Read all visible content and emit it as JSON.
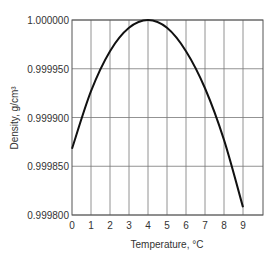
{
  "chart_data": {
    "type": "line",
    "title": "",
    "xlabel": "Temperature, °C",
    "ylabel": "Density, g/cm³",
    "xlim": [
      0,
      10
    ],
    "ylim": [
      0.9998,
      1.0
    ],
    "grid": true,
    "legend": null,
    "x_ticks": [
      "0",
      "1",
      "2",
      "3",
      "4",
      "5",
      "6",
      "7",
      "8",
      "9"
    ],
    "y_ticks": [
      "0.999800",
      "0.999850",
      "0.999900",
      "0.999950",
      "1.000000"
    ],
    "series": [
      {
        "name": "Water density",
        "x": [
          0,
          1,
          2,
          3,
          4,
          5,
          6,
          7,
          8,
          9
        ],
        "values": [
          0.999868,
          0.999927,
          0.999968,
          0.999992,
          1.0,
          0.999992,
          0.999968,
          0.99993,
          0.999877,
          0.999808
        ]
      }
    ]
  }
}
